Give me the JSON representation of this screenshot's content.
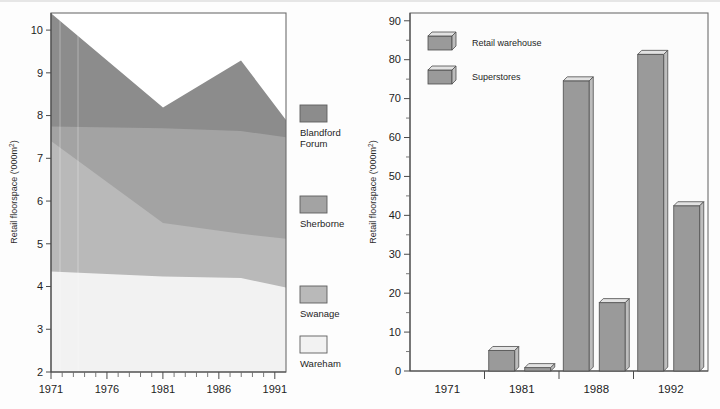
{
  "figure": {
    "background": "#fdfdfd",
    "panels": [
      "area-chart-left",
      "bar-chart-right"
    ]
  },
  "chart_data": [
    {
      "id": "left-panel",
      "type": "area",
      "stacked": true,
      "title": "",
      "xlabel": "",
      "ylabel": "Retail floorspace ('000m²)",
      "ylabel_plain": "Retail floorspace ('000m2)",
      "xlim": [
        1971,
        1992
      ],
      "ylim": [
        2,
        10.4
      ],
      "yticks": [
        2,
        3,
        4,
        5,
        6,
        7,
        8,
        9,
        10
      ],
      "ytick_labels": [
        "2",
        "3",
        "4",
        "5",
        "6",
        "7",
        "8",
        "9",
        "10"
      ],
      "xticks": [
        1971,
        1972,
        1973,
        1974,
        1975,
        1976,
        1977,
        1978,
        1979,
        1980,
        1981,
        1982,
        1983,
        1984,
        1985,
        1986,
        1987,
        1988,
        1989,
        1990,
        1991
      ],
      "xtick_labels_shown": [
        "1971",
        "1976",
        "1981",
        "1986",
        "1991"
      ],
      "xtick_labels_shown_at": [
        1971,
        1976,
        1981,
        1986,
        1991
      ],
      "grid": false,
      "legend_position": "right",
      "x": [
        1971,
        1981,
        1988,
        1992
      ],
      "series": [
        {
          "name": "Wareham",
          "color": "#f2f2f2",
          "cumulative_top": [
            3.72,
            3.58,
            3.54,
            3.28
          ]
        },
        {
          "name": "Swanage",
          "color": "#b9b9b9",
          "cumulative_top": [
            7.35,
            5.4,
            5.1,
            4.96
          ]
        },
        {
          "name": "Sherborne",
          "color": "#a3a3a3",
          "cumulative_top": [
            7.75,
            7.7,
            7.62,
            7.45
          ]
        },
        {
          "name": "Blandford Forum",
          "color": "#8c8c8c",
          "cumulative_top": [
            10.35,
            7.78,
            9.3,
            8.32
          ]
        }
      ],
      "legend": [
        {
          "label_line1": "Blandford",
          "label_line2": "Forum",
          "label": "Blandford Forum",
          "color": "#8c8c8c"
        },
        {
          "label_line1": "Sherborne",
          "label_line2": "",
          "label": "Sherborne",
          "color": "#a3a3a3"
        },
        {
          "label_line1": "Swanage",
          "label_line2": "",
          "label": "Swanage",
          "color": "#b9b9b9"
        },
        {
          "label_line1": "Wareham",
          "label_line2": "",
          "label": "Wareham",
          "color": "#f2f2f2"
        }
      ]
    },
    {
      "id": "right-panel",
      "type": "bar",
      "title": "",
      "xlabel": "",
      "ylabel": "Retail floorspace ('000m²)",
      "ylabel_plain": "Retail floorspace ('000m2)",
      "categories": [
        "1971",
        "1981",
        "1988",
        "1992"
      ],
      "ylim": [
        0,
        92
      ],
      "yticks": [
        0,
        10,
        20,
        30,
        40,
        50,
        60,
        70,
        80,
        90
      ],
      "ytick_labels": [
        "0",
        "10",
        "20",
        "30",
        "40",
        "50",
        "60",
        "70",
        "80",
        "90"
      ],
      "yticks_minor": [
        5,
        15,
        25,
        35,
        45,
        55,
        65,
        75,
        85
      ],
      "grid": false,
      "legend_position": "upper-left-inside",
      "series": [
        {
          "name": "Retail warehouse",
          "color": "#9a9a9a",
          "values": [
            0,
            6.3,
            75.6,
            82.4
          ]
        },
        {
          "name": "Superstores",
          "color": "#9a9a9a",
          "values": [
            0,
            1.9,
            18.6,
            43.5
          ]
        }
      ],
      "legend": [
        {
          "label": "Retail warehouse",
          "color": "#9a9a9a"
        },
        {
          "label": "Superstores",
          "color": "#9a9a9a"
        }
      ]
    }
  ]
}
